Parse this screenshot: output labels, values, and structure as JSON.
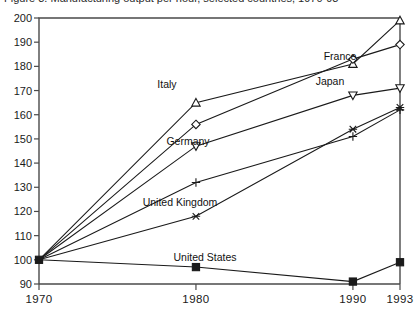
{
  "chart_data": {
    "type": "line",
    "title": "",
    "xlabel": "",
    "ylabel": "",
    "x": [
      1970,
      1980,
      1990,
      1993
    ],
    "xticklabels": [
      "1970",
      "1980",
      "1990",
      "1993"
    ],
    "xlim": [
      1970,
      1993
    ],
    "ylim": [
      90,
      200
    ],
    "yticks": [
      90,
      100,
      110,
      120,
      130,
      140,
      150,
      160,
      170,
      180,
      190,
      200
    ],
    "yticklabels": [
      "90",
      "100",
      "110",
      "120",
      "130",
      "140",
      "150",
      "160",
      "170",
      "180",
      "190",
      "200"
    ],
    "grid": false,
    "legend_position": "inline-annotations",
    "series": [
      {
        "name": "Italy",
        "marker": "triangle-up",
        "values": [
          100,
          165,
          181,
          199
        ]
      },
      {
        "name": "France",
        "marker": "diamond",
        "values": [
          100,
          156,
          183,
          189
        ]
      },
      {
        "name": "Japan",
        "marker": "triangle-down",
        "values": [
          100,
          147,
          168,
          171
        ]
      },
      {
        "name": "Germany",
        "marker": "plus",
        "values": [
          100,
          132,
          151,
          162
        ]
      },
      {
        "name": "United Kingdom",
        "marker": "cross",
        "values": [
          100,
          118,
          154,
          163
        ]
      },
      {
        "name": "United States",
        "marker": "square",
        "values": [
          100,
          97,
          91,
          99
        ]
      }
    ],
    "annotations": [
      {
        "text": "Italy",
        "series": "Italy",
        "x": 167,
        "y": 88
      },
      {
        "text": "France",
        "series": "France",
        "x": 340,
        "y": 60
      },
      {
        "text": "Japan",
        "series": "Japan",
        "x": 330,
        "y": 85
      },
      {
        "text": "Germany",
        "series": "Germany",
        "x": 188,
        "y": 145
      },
      {
        "text": "United Kingdom",
        "series": "United Kingdom",
        "x": 180,
        "y": 206
      },
      {
        "text": "United States",
        "series": "United States",
        "x": 205,
        "y": 261
      }
    ]
  },
  "title_strip": {
    "text": "Figure 3. Manufacturing output per hour, selected countries, 1970-93"
  }
}
